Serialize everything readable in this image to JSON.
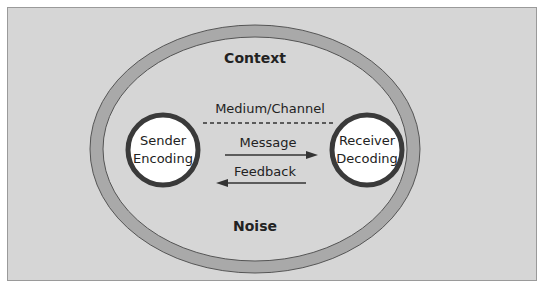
{
  "diagram": {
    "outer_label": "Context",
    "bottom_label": "Noise",
    "channel_label": "Medium/Channel",
    "sender": {
      "line1": "Sender",
      "line2": "Encoding"
    },
    "receiver": {
      "line1": "Receiver",
      "line2": "Decoding"
    },
    "arrows": [
      {
        "label": "Message",
        "direction": "right"
      },
      {
        "label": "Feedback",
        "direction": "left"
      }
    ],
    "colors": {
      "background": "#d6d6d6",
      "ellipse_band": "#a9a9a9",
      "circle_fill": "#ffffff",
      "circle_border": "#3a3a3a",
      "text": "#222222"
    }
  }
}
